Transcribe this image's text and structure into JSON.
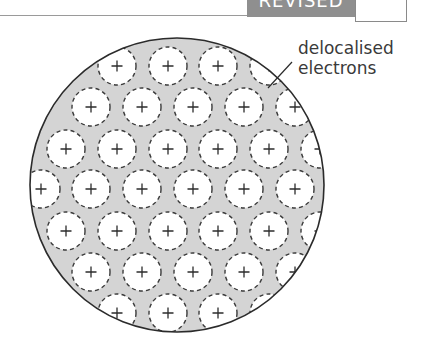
{
  "header": {
    "badge_label": "REVISED",
    "checkbox_checked": false
  },
  "diagram": {
    "outer_circle": {
      "cx": 177,
      "cy": 185,
      "r": 147
    },
    "ion_radius": 19,
    "ion_symbol": "+",
    "electron_sea_color": "#d4d4d4",
    "rows": [
      {
        "y": 66,
        "x": [
          117,
          168,
          218,
          269
        ]
      },
      {
        "y": 107,
        "x": [
          91,
          142,
          193,
          244,
          295
        ]
      },
      {
        "y": 149,
        "x": [
          66,
          117,
          168,
          218,
          269,
          320
        ]
      },
      {
        "y": 189,
        "x": [
          41,
          91,
          142,
          193,
          244,
          295
        ]
      },
      {
        "y": 231,
        "x": [
          66,
          117,
          168,
          218,
          269,
          320
        ]
      },
      {
        "y": 272,
        "x": [
          91,
          142,
          193,
          244,
          295
        ]
      },
      {
        "y": 313,
        "x": [
          117,
          168,
          218,
          269
        ]
      }
    ],
    "annotation": {
      "line1": "delocalised",
      "line2": "electrons",
      "leader": {
        "x1": 292,
        "y1": 62,
        "x2": 268,
        "y2": 88
      }
    }
  }
}
